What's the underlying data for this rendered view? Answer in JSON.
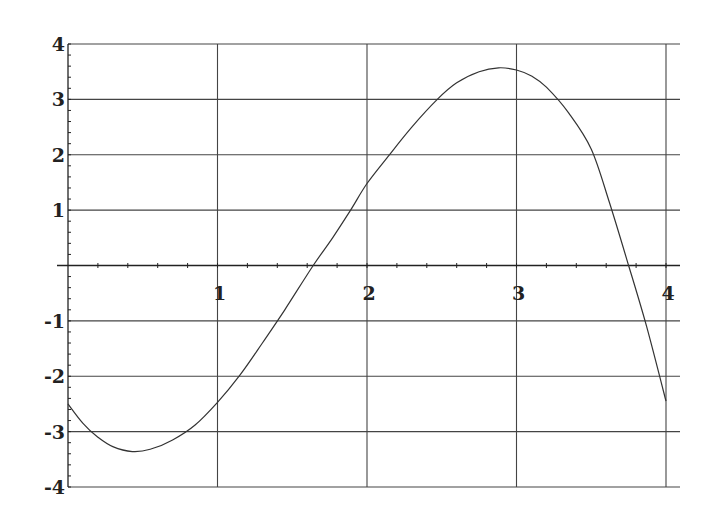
{
  "chart_data": {
    "type": "line",
    "title": "",
    "xlabel": "",
    "ylabel": "",
    "xlim": [
      0,
      4
    ],
    "ylim": [
      -4,
      4
    ],
    "grid": true,
    "legend": null,
    "x_ticks": [
      1,
      2,
      3,
      4
    ],
    "x_tick_labels": [
      "1",
      "2",
      "3",
      "4"
    ],
    "y_ticks": [
      -4,
      -3,
      -2,
      -1,
      1,
      2,
      3,
      4
    ],
    "y_tick_labels": [
      "-4",
      "-3",
      "-2",
      "-1",
      "1",
      "2",
      "3",
      "4"
    ],
    "series": [
      {
        "name": "curve",
        "x": [
          0,
          0.1,
          0.2,
          0.3,
          0.43,
          0.55,
          0.7,
          0.85,
          1.0,
          1.15,
          1.3,
          1.45,
          1.64,
          1.77,
          1.89,
          2.0,
          2.15,
          2.3,
          2.47,
          2.6,
          2.75,
          2.88,
          3.0,
          3.1,
          3.2,
          3.35,
          3.5,
          3.62,
          3.75,
          3.87,
          4.0
        ],
        "y": [
          -2.5,
          -2.85,
          -3.1,
          -3.27,
          -3.36,
          -3.32,
          -3.15,
          -2.88,
          -2.47,
          -1.98,
          -1.4,
          -0.8,
          0.0,
          0.5,
          1.0,
          1.48,
          2.0,
          2.5,
          3.0,
          3.3,
          3.5,
          3.57,
          3.53,
          3.42,
          3.22,
          2.75,
          2.1,
          1.15,
          0.0,
          -1.1,
          -2.45
        ]
      }
    ]
  }
}
